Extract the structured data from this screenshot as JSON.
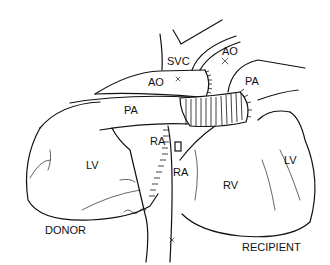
{
  "figure": {
    "type": "anatomical-line-drawing",
    "line_color": "#111111",
    "background": "#ffffff"
  },
  "labels": {
    "svc": "SVC",
    "ao_recipient": "AO",
    "ao_donor": "AO",
    "pa_recipient": "PA",
    "pa_donor": "PA",
    "ra_upper": "RA",
    "ra_lower": "RA",
    "lv_donor": "LV",
    "lv_recipient": "LV",
    "rv": "RV",
    "donor": "DONOR",
    "recipient": "RECIPIENT",
    "signature": "Tiller"
  }
}
